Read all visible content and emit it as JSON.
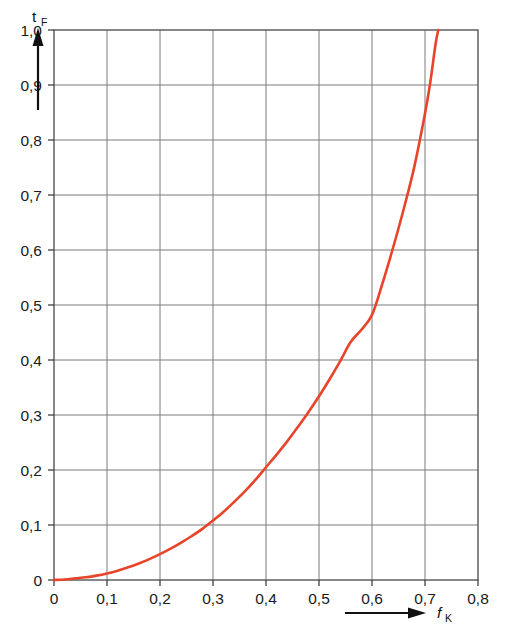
{
  "chart_data": {
    "type": "line",
    "title": "",
    "subtitle": "",
    "xlabel": "f",
    "xlabel_sub": "K",
    "ylabel": "t",
    "ylabel_sub": "F",
    "xlim": [
      0,
      0.8
    ],
    "ylim": [
      0,
      1.0
    ],
    "grid": true,
    "legend": null,
    "x_ticks": [
      "0",
      "0,1",
      "0,2",
      "0,3",
      "0,4",
      "0,5",
      "0,6",
      "0,7",
      "0,8"
    ],
    "x_tick_values": [
      0,
      0.1,
      0.2,
      0.3,
      0.4,
      0.5,
      0.6,
      0.7,
      0.8
    ],
    "y_ticks": [
      "0",
      "0,1",
      "0,2",
      "0,3",
      "0,4",
      "0,5",
      "0,6",
      "0,7",
      "0,8",
      "0,9",
      "1,0"
    ],
    "y_tick_values": [
      0,
      0.1,
      0.2,
      0.3,
      0.4,
      0.5,
      0.6,
      0.7,
      0.8,
      0.9,
      1.0
    ],
    "series": [
      {
        "name": "curve",
        "color": "#e8442a",
        "width": 2.6,
        "x": [
          0.0,
          0.02,
          0.04,
          0.06,
          0.08,
          0.1,
          0.12,
          0.14,
          0.16,
          0.18,
          0.2,
          0.22,
          0.24,
          0.26,
          0.28,
          0.3,
          0.32,
          0.34,
          0.36,
          0.38,
          0.4,
          0.42,
          0.44,
          0.46,
          0.48,
          0.5,
          0.52,
          0.54,
          0.56,
          0.58,
          0.6,
          0.62,
          0.64,
          0.66,
          0.68,
          0.7,
          0.71,
          0.72,
          0.725
        ],
        "y": [
          0.0,
          0.001,
          0.003,
          0.005,
          0.008,
          0.012,
          0.017,
          0.023,
          0.03,
          0.038,
          0.047,
          0.057,
          0.068,
          0.08,
          0.093,
          0.108,
          0.124,
          0.142,
          0.161,
          0.182,
          0.205,
          0.228,
          0.252,
          0.278,
          0.305,
          0.334,
          0.365,
          0.398,
          0.433,
          0.455,
          0.482,
          0.54,
          0.605,
          0.675,
          0.752,
          0.848,
          0.905,
          0.975,
          1.0
        ]
      }
    ],
    "annotations": []
  },
  "axis_arrows": {
    "y_arrow": "upward-arrow",
    "x_arrow": "rightward-arrow"
  },
  "colors": {
    "curve": "#e8442a",
    "grid": "#7b7b7b",
    "frame": "#555555",
    "background": "#ffffff",
    "text": "#1a1a1a"
  }
}
